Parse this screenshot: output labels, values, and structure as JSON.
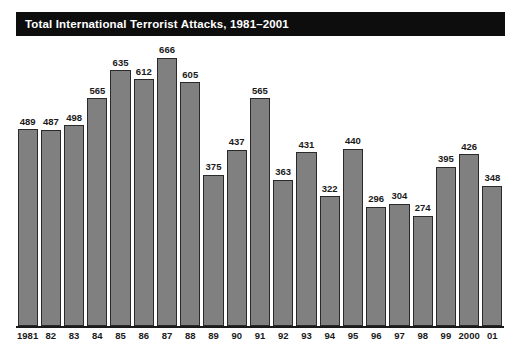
{
  "title": {
    "text": "Total International Terrorist Attacks, 1981–2001"
  },
  "colors": {
    "banner_background": "#0d0d0d",
    "banner_text": "#ffffff",
    "bar_fill": "#808080",
    "bar_outline": "#2a2a2a",
    "axis": "#1a1a1a",
    "page_background": "#ffffff"
  },
  "chart_data": {
    "type": "bar",
    "title": "Total International Terrorist Attacks, 1981–2001",
    "xlabel": "",
    "ylabel": "",
    "grid": false,
    "legend": "none",
    "ylim": [
      0,
      700
    ],
    "categories": [
      "1981",
      "82",
      "83",
      "84",
      "85",
      "86",
      "87",
      "88",
      "89",
      "90",
      "91",
      "92",
      "93",
      "94",
      "95",
      "96",
      "97",
      "98",
      "99",
      "2000",
      "01"
    ],
    "values": [
      489,
      487,
      498,
      565,
      635,
      612,
      666,
      605,
      375,
      437,
      565,
      363,
      431,
      322,
      440,
      296,
      304,
      274,
      395,
      426,
      348
    ],
    "data_labels": [
      "489",
      "487",
      "498",
      "565",
      "635",
      "612",
      "666",
      "605",
      "375",
      "437",
      "565",
      "363",
      "431",
      "322",
      "440",
      "296",
      "304",
      "274",
      "395",
      "426",
      "348"
    ]
  }
}
